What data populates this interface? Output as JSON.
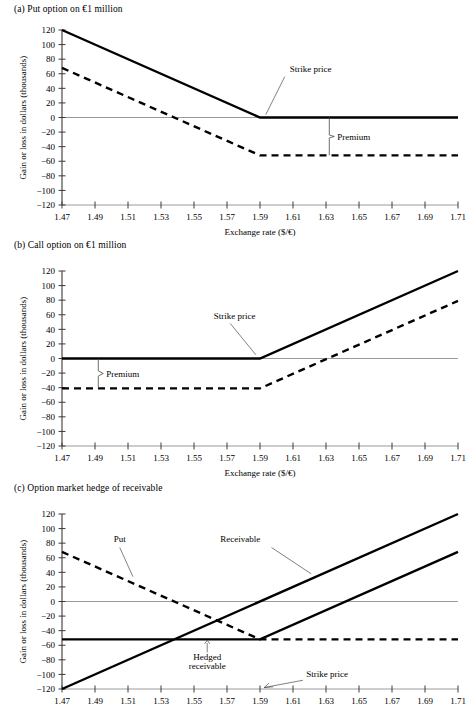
{
  "figure": {
    "panels": [
      {
        "id": "a",
        "title": "(a) Put option on €1 million",
        "xlabel": "Exchange rate ($/€)",
        "ylabel": "Gain or loss in dollars (thousands)"
      },
      {
        "id": "b",
        "title": "(b) Call option on €1 million",
        "xlabel": "Exchange rate ($/€)",
        "ylabel": "Gain or loss in dollars (thousands)"
      },
      {
        "id": "c",
        "title": "(c) Option market hedge of receivable",
        "xlabel": "",
        "ylabel": "Gain or loss in dollars (thousands)"
      }
    ]
  },
  "axes": {
    "x_ticks": [
      "1.47",
      "1.49",
      "1.51",
      "1.53",
      "1.55",
      "1.57",
      "1.59",
      "1.61",
      "1.63",
      "1.65",
      "1.67",
      "1.69",
      "1.71"
    ],
    "y_ticks": [
      "120",
      "100",
      "80",
      "60",
      "40",
      "20",
      "0",
      "−20",
      "−40",
      "−60",
      "−80",
      "−100",
      "−120"
    ],
    "xlim": [
      1.47,
      1.71
    ],
    "ylim": [
      -120,
      120
    ],
    "x_step": 0.02,
    "y_step": 20
  },
  "annotations": {
    "strike_price": "Strike price",
    "premium": "Premium",
    "put": "Put",
    "receivable": "Receivable",
    "hedged_receivable_line1": "Hedged",
    "hedged_receivable_line2": "receivable"
  },
  "chart_data": {
    "type": "line",
    "xlabel": "Exchange rate ($/€)",
    "ylabel": "Gain or loss in dollars (thousands)",
    "xlim": [
      1.47,
      1.71
    ],
    "ylim": [
      -120,
      120
    ],
    "x_ticks": [
      1.47,
      1.49,
      1.51,
      1.53,
      1.55,
      1.57,
      1.59,
      1.61,
      1.63,
      1.65,
      1.67,
      1.69,
      1.71
    ],
    "y_ticks": [
      -120,
      -100,
      -80,
      -60,
      -40,
      -20,
      0,
      20,
      40,
      60,
      80,
      100,
      120
    ],
    "grid": false,
    "legend": "none",
    "strike_price": 1.59,
    "put_premium": -52,
    "call_premium": -41,
    "panels": [
      {
        "id": "a",
        "title": "(a) Put option on €1 million",
        "series": [
          {
            "name": "Put option gross payoff",
            "style": "solid",
            "points": [
              [
                1.47,
                120
              ],
              [
                1.59,
                0
              ],
              [
                1.71,
                0
              ]
            ]
          },
          {
            "name": "Put option net of premium",
            "style": "dashed",
            "points": [
              [
                1.47,
                68
              ],
              [
                1.59,
                -52
              ],
              [
                1.71,
                -52
              ]
            ]
          }
        ],
        "annotations": [
          {
            "text": "Strike price",
            "points_to": [
              1.59,
              0
            ]
          },
          {
            "text": "Premium",
            "bracket_from": [
              1.632,
              0
            ],
            "bracket_to": [
              1.632,
              -52
            ]
          }
        ]
      },
      {
        "id": "b",
        "title": "(b) Call option on €1 million",
        "series": [
          {
            "name": "Call option gross payoff",
            "style": "solid",
            "points": [
              [
                1.47,
                0
              ],
              [
                1.59,
                0
              ],
              [
                1.71,
                120
              ]
            ]
          },
          {
            "name": "Call option net of premium",
            "style": "dashed",
            "points": [
              [
                1.47,
                -41
              ],
              [
                1.59,
                -41
              ],
              [
                1.71,
                79
              ]
            ]
          }
        ],
        "annotations": [
          {
            "text": "Strike price",
            "points_to": [
              1.59,
              0
            ]
          },
          {
            "text": "Premium",
            "bracket_from": [
              1.492,
              0
            ],
            "bracket_to": [
              1.492,
              -41
            ]
          }
        ]
      },
      {
        "id": "c",
        "title": "(c) Option market hedge of receivable",
        "series": [
          {
            "name": "Put",
            "style": "dashed",
            "points": [
              [
                1.47,
                68
              ],
              [
                1.59,
                -52
              ],
              [
                1.71,
                -52
              ]
            ]
          },
          {
            "name": "Receivable",
            "style": "solid",
            "points": [
              [
                1.47,
                -120
              ],
              [
                1.71,
                120
              ]
            ]
          },
          {
            "name": "Hedged receivable",
            "style": "solid",
            "points": [
              [
                1.47,
                -52
              ],
              [
                1.59,
                -52
              ],
              [
                1.71,
                68
              ]
            ]
          }
        ],
        "annotations": [
          {
            "text": "Put",
            "points_to": [
              1.513,
              32
            ]
          },
          {
            "text": "Receivable",
            "points_to": [
              1.622,
              36
            ]
          },
          {
            "text": "Hedged receivable",
            "points_to": [
              1.558,
              -52
            ]
          },
          {
            "text": "Strike price",
            "points_to": [
              1.59,
              -120
            ]
          }
        ]
      }
    ]
  }
}
